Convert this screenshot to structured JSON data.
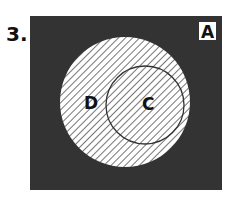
{
  "problem_number": "3.",
  "universe_label": "A",
  "sets": [
    {
      "label": "D",
      "shading": "hatched"
    },
    {
      "label": "C",
      "shading": "hatched"
    }
  ],
  "colors": {
    "background": "#333333",
    "hatch": "#555555",
    "fill": "#ffffff"
  }
}
